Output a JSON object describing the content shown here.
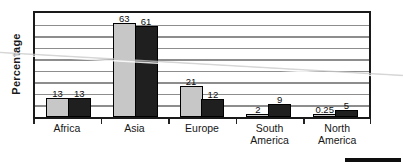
{
  "chart_data": {
    "type": "bar",
    "title": "",
    "xlabel": "",
    "ylabel": "Percentage",
    "categories": [
      "Africa",
      "Asia",
      "Europe",
      "South America",
      "North America"
    ],
    "category_label_lines": [
      [
        "Africa"
      ],
      [
        "Asia"
      ],
      [
        "Europe"
      ],
      [
        "South America"
      ],
      [
        "North",
        "America"
      ]
    ],
    "series": [
      {
        "name": "light-gray-bars",
        "color": "#c7c7c7",
        "values": [
          13,
          63,
          21,
          2,
          0.25
        ],
        "labels": [
          "13",
          "63",
          "21",
          "2",
          "0.25"
        ]
      },
      {
        "name": "dark-bars",
        "color": "#1f1f1f",
        "values": [
          13,
          61,
          12,
          9,
          5
        ],
        "labels": [
          "13",
          "61",
          "12",
          "9",
          "5"
        ]
      }
    ],
    "ylim": [
      0,
      70
    ],
    "y_tick_labels_shown": false,
    "gridlines": {
      "horizontal": true,
      "count": 8,
      "color": "#8d8d8d"
    },
    "legend_shown": false,
    "plot_border_color": "#1a1a1a",
    "bar_border_color": "#000000"
  },
  "decor": {
    "bottom_right_rule_color": "#0e0e0e",
    "crease_line_color": "#c9c9c9"
  }
}
